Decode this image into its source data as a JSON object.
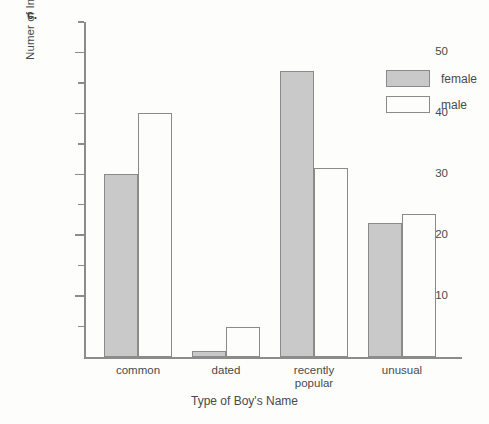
{
  "panel_label": "c.",
  "chart_data": {
    "type": "bar",
    "title": "",
    "xlabel": "Type of Boy's Name",
    "ylabel": "Numer of Individuals Who Preferred Name",
    "ylim": [
      0,
      55
    ],
    "grid": false,
    "legend_position": "top-right",
    "categories": [
      "common",
      "dated",
      "recently\npopular",
      "unusual"
    ],
    "y_major_ticks": [
      10,
      20,
      30,
      40,
      50
    ],
    "y_major_tick_labels": [
      "10",
      "20",
      "30",
      "40",
      "50"
    ],
    "y_minor_ticks": [
      5,
      15,
      25,
      35,
      45,
      55
    ],
    "series": [
      {
        "name": "female",
        "color": "#c9c9c9",
        "values": [
          30,
          1,
          47,
          22
        ]
      },
      {
        "name": "male",
        "color": "#ffffff",
        "values": [
          40,
          5,
          31,
          23.5
        ]
      }
    ]
  },
  "legend": {
    "items": [
      {
        "label": "female",
        "swatch": "female"
      },
      {
        "label": "male",
        "swatch": "male"
      }
    ]
  }
}
